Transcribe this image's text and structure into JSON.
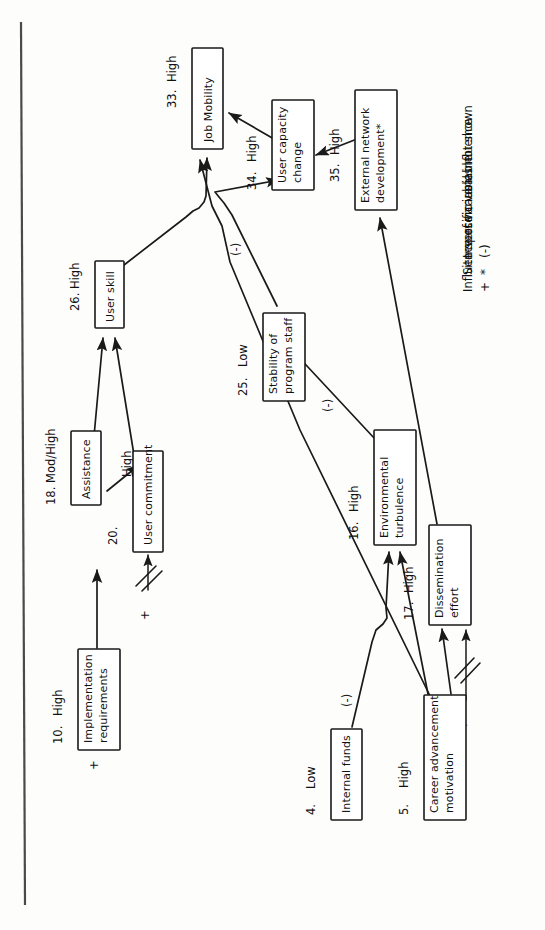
{
  "diagram": {
    "orientation": "rotated-90-ccw",
    "nodes": [
      {
        "id": "n33",
        "number": "33.",
        "level": "High",
        "label_line1": "Job Mobility",
        "label_line2": ""
      },
      {
        "id": "n34",
        "number": "34.",
        "level": "High",
        "label_line1": "User capacity",
        "label_line2": "change"
      },
      {
        "id": "n35",
        "number": "35.",
        "level": "High",
        "label_line1": "External network",
        "label_line2": "development*"
      },
      {
        "id": "n26",
        "number": "26.",
        "level": "High",
        "label_line1": "User skill",
        "label_line2": ""
      },
      {
        "id": "n25",
        "number": "25.",
        "level": "Low",
        "label_line1": "Stability of",
        "label_line2": "program staff"
      },
      {
        "id": "n18",
        "number": "18.",
        "level": "Mod/High",
        "label_line1": "Assistance",
        "label_line2": ""
      },
      {
        "id": "n20",
        "number": "20.",
        "level": "",
        "label_line1": "User commitment",
        "label_line2": ""
      },
      {
        "id": "n16",
        "number": "16.",
        "level": "High",
        "label_line1": "Environmental",
        "label_line2": "turbulence"
      },
      {
        "id": "n17",
        "number": "17.",
        "level": "High",
        "label_line1": "Dissemination",
        "label_line2": "effort"
      },
      {
        "id": "n10",
        "number": "10.",
        "level": "High",
        "label_line1": "Implementation",
        "label_line2": "requirements"
      },
      {
        "id": "n4",
        "number": "4.",
        "level": "Low",
        "label_line1": "Internal funds",
        "label_line2": ""
      },
      {
        "id": "n5",
        "number": "5.",
        "level": "High",
        "label_line1": "Career advancement",
        "label_line2": "motivation"
      }
    ],
    "edge_labels": {
      "assistance_to_commitment": "High",
      "stability_negative": "(-)",
      "turbulence_negative": "(-)",
      "funds_negative": "(-)",
      "external_plus": "+",
      "commitment_plus": "+",
      "implementation_plus": "+",
      "dissemination_plus": "+"
    }
  },
  "legend": {
    "items": [
      {
        "mark": "+",
        "text": "Influence of variables not shown"
      },
      {
        "mark": "*",
        "text": "Site-specific variable"
      },
      {
        "mark": "(-)",
        "text": "Inverse causal influence"
      }
    ]
  },
  "colors": {
    "ink": "#1a1a1a",
    "paper": "#fdfdfc",
    "rule": "#4a4a4a"
  }
}
